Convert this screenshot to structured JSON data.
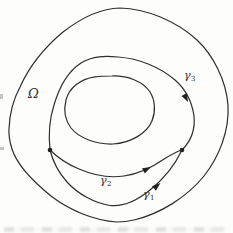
{
  "figure": {
    "labels": {
      "omega": "Ω",
      "gamma1": {
        "base": "γ",
        "sub": "1"
      },
      "gamma2": {
        "base": "γ",
        "sub": "2"
      },
      "gamma3": {
        "base": "γ",
        "sub": "3"
      }
    },
    "curves": [
      {
        "name": "outer-boundary",
        "label": "Ω region boundary",
        "closed": true,
        "arrows": 0
      },
      {
        "name": "gamma3-upper-arc",
        "label": "γ3",
        "closed": false,
        "arrows": 1
      },
      {
        "name": "gamma1-lower-arc",
        "label": "γ1",
        "closed": false,
        "arrows": 1
      },
      {
        "name": "gamma2-chord",
        "label": "γ2",
        "closed": false,
        "arrows": 1
      },
      {
        "name": "inner-curve",
        "label": "",
        "closed": true,
        "arrows": 0
      }
    ],
    "junction_points": 2,
    "colors": {
      "stroke": "#2e2e2e",
      "background": "#fdfdfc",
      "label_text": "#2f2f2f"
    }
  }
}
